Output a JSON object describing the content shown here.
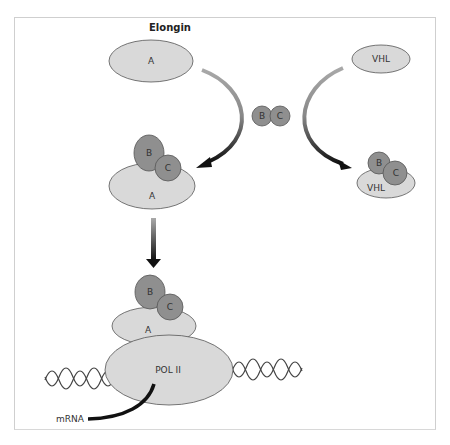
{
  "title": "Elongin",
  "colors": {
    "light_fill": "#d9d9d9",
    "dark_fill": "#8f8f8f",
    "stroke": "#555555",
    "arrow_dark": "#111111",
    "arrow_light": "#9a9a9a"
  },
  "top": {
    "elongin_a": "A",
    "vhl": "VHL",
    "free_b": "B",
    "free_c": "C"
  },
  "middle": {
    "complex_b": "B",
    "complex_c": "C",
    "complex_a": "A",
    "vhl_b": "B",
    "vhl_c": "C",
    "vhl_label": "VHL"
  },
  "bottom": {
    "b": "B",
    "c": "C",
    "a": "A",
    "pol": "POL II",
    "mrna": "mRNA"
  }
}
